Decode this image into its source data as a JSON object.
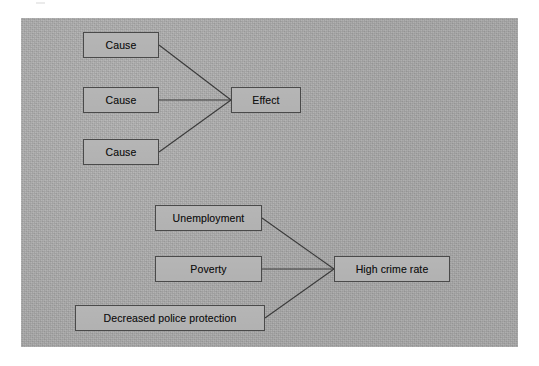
{
  "figure": {
    "background_color": "#ffffff",
    "panel_color": "#a9a9a9",
    "node_fill": "#b0b0b0",
    "node_border": "#4a4a4a",
    "connector_color": "#3a3a3a",
    "text_color": "#121212"
  },
  "diagrams": [
    {
      "id": "generic-cause-effect",
      "causes": [
        {
          "label": "Cause"
        },
        {
          "label": "Cause"
        },
        {
          "label": "Cause"
        }
      ],
      "effect": {
        "label": "Effect"
      }
    },
    {
      "id": "crime-cause-effect",
      "causes": [
        {
          "label": "Unemployment"
        },
        {
          "label": "Poverty"
        },
        {
          "label": "Decreased police protection"
        }
      ],
      "effect": {
        "label": "High crime rate"
      }
    }
  ]
}
